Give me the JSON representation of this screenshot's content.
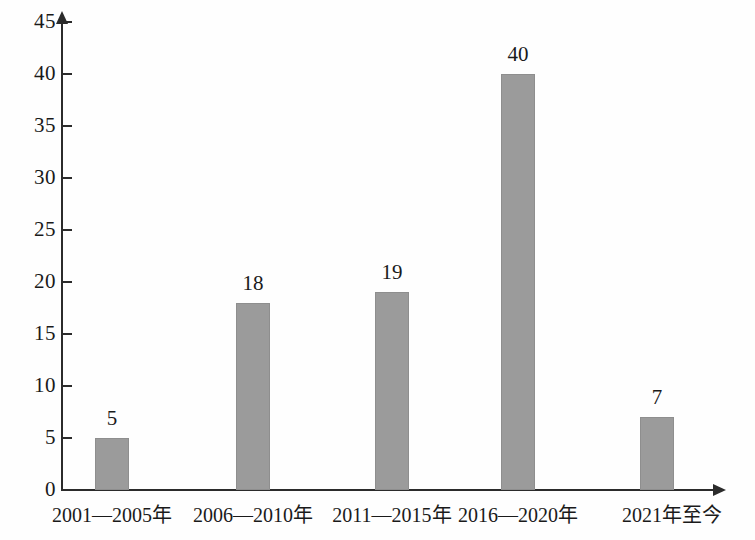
{
  "chart_data": {
    "type": "bar",
    "title": "",
    "subtitle": "",
    "xlabel": "",
    "ylabel": "",
    "categories": [
      "2001—2005年",
      "2006—2010年",
      "2011—2015年",
      "2016—2020年",
      "2021年至今"
    ],
    "values": [
      5,
      18,
      19,
      40,
      7
    ],
    "value_labels": [
      "5",
      "18",
      "19",
      "40",
      "7"
    ],
    "ylim": [
      0,
      45
    ],
    "y_ticks": [
      0,
      5,
      10,
      15,
      20,
      25,
      30,
      35,
      40,
      45
    ],
    "y_tick_labels": [
      "0",
      "5",
      "10",
      "15",
      "20",
      "25",
      "30",
      "35",
      "40",
      "45"
    ],
    "grid": false,
    "legend": null,
    "legend_position": "none",
    "series": [
      {
        "name": "",
        "values": [
          5,
          18,
          19,
          40,
          7
        ],
        "color": "#9b9b9b"
      }
    ],
    "annotations": []
  },
  "style": {
    "bar_fill": "#9b9b9b",
    "bar_stroke": "#8e8e8e",
    "axis_color": "#2b2b2b",
    "text_color": "#1a1a1a",
    "background": "#fefefe"
  },
  "axis": {
    "y_arrow_icon": "arrow-up-icon",
    "x_arrow_icon": "arrow-right-icon"
  }
}
